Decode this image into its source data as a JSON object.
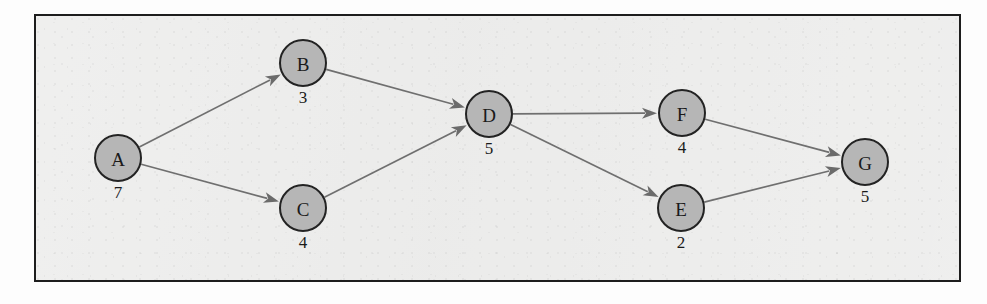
{
  "figure": {
    "title": "",
    "background_color": "#ececeb",
    "frame_color": "#1d1d1d",
    "node_fill_color": "#b6b6b6",
    "node_stroke_color": "#232323",
    "edge_color": "#6f6f6f"
  },
  "chart_data": {
    "type": "diagram",
    "diagram_kind": "directed-acyclic-graph",
    "title": "",
    "xlabel": "",
    "ylabel": "",
    "grid": false,
    "legend": "none",
    "node_radius": 23,
    "nodes": [
      {
        "id": "A",
        "label": "A",
        "weight": "7",
        "cx": 118,
        "cy": 158
      },
      {
        "id": "B",
        "label": "B",
        "weight": "3",
        "cx": 303,
        "cy": 63
      },
      {
        "id": "C",
        "label": "C",
        "weight": "4",
        "cx": 303,
        "cy": 208
      },
      {
        "id": "D",
        "label": "D",
        "weight": "5",
        "cx": 489,
        "cy": 114
      },
      {
        "id": "F",
        "label": "F",
        "weight": "4",
        "cx": 682,
        "cy": 113
      },
      {
        "id": "E",
        "label": "E",
        "weight": "2",
        "cx": 681,
        "cy": 208
      },
      {
        "id": "G",
        "label": "G",
        "weight": "5",
        "cx": 865,
        "cy": 162
      }
    ],
    "edges": [
      {
        "from": "A",
        "to": "B",
        "directed": true
      },
      {
        "from": "A",
        "to": "C",
        "directed": true
      },
      {
        "from": "B",
        "to": "D",
        "directed": true
      },
      {
        "from": "C",
        "to": "D",
        "directed": true
      },
      {
        "from": "D",
        "to": "F",
        "directed": true
      },
      {
        "from": "D",
        "to": "E",
        "directed": true
      },
      {
        "from": "F",
        "to": "G",
        "directed": true
      },
      {
        "from": "E",
        "to": "G",
        "directed": true
      }
    ],
    "node_ids": [
      "A",
      "B",
      "C",
      "D",
      "F",
      "E",
      "G"
    ],
    "node_labels": [
      "A",
      "B",
      "C",
      "D",
      "F",
      "E",
      "G"
    ],
    "node_weights": [
      7,
      3,
      4,
      5,
      4,
      2,
      5
    ]
  }
}
